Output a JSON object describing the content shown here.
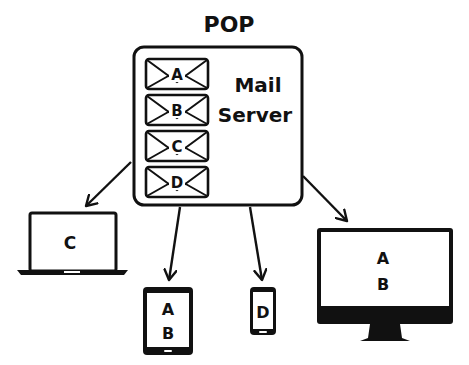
{
  "title": "POP",
  "server": {
    "label_line1": "Mail",
    "label_line2": "Server",
    "messages": [
      "A",
      "B",
      "C",
      "D"
    ]
  },
  "devices": {
    "laptop": {
      "messages": [
        "C"
      ]
    },
    "tablet": {
      "messages": [
        "A",
        "B"
      ]
    },
    "phone": {
      "messages": [
        "D"
      ]
    },
    "desktop": {
      "messages": [
        "A",
        "B"
      ]
    }
  },
  "colors": {
    "stroke": "#111111",
    "background": "#ffffff"
  }
}
